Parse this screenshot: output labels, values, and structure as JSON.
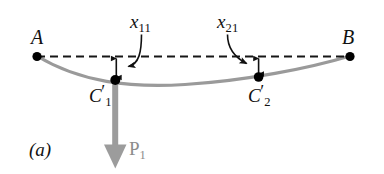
{
  "figure": {
    "panel_label": "(a)",
    "caption_kind": "beam-deflection-diagram",
    "canvas": {
      "width": 384,
      "height": 174,
      "background": "#ffffff"
    },
    "colors": {
      "curve": "#9a9a9a",
      "force_arrow": "#9c9c9c",
      "dashed_line": "#1a1a1a",
      "node": "#000000",
      "text": "#111111",
      "force_label_text": "#8c8c8c"
    },
    "supports": [
      {
        "name": "A",
        "label": "A",
        "x": 37,
        "y": 56
      },
      {
        "name": "B",
        "label": "B",
        "x": 350,
        "y": 56
      }
    ],
    "reference_line": {
      "label": "undeformed-axis",
      "style": "dashed",
      "x1": 37,
      "y1": 56,
      "x2": 350,
      "y2": 56,
      "dash": "8 5"
    },
    "deflected_curve": {
      "label": "deflected-beam",
      "lowest_y": 84,
      "lowest_x": 185,
      "stroke_width": 3
    },
    "stations": [
      {
        "name": "C1",
        "label_main": "C",
        "label_prime": "′",
        "label_sub": "1",
        "x": 115,
        "y": 80,
        "deflection_label_main": "x",
        "deflection_label_sub": "11",
        "deflection_from_y": 57,
        "deflection_to_y": 79
      },
      {
        "name": "C2",
        "label_main": "C",
        "label_prime": "′",
        "label_sub": "2",
        "x": 258,
        "y": 77,
        "deflection_label_main": "x",
        "deflection_label_sub": "21",
        "deflection_from_y": 57,
        "deflection_to_y": 75
      }
    ],
    "force": {
      "name": "P1",
      "label_main": "P",
      "label_sub": "1",
      "direction": "down",
      "applied_at_x": 115,
      "from_y": 82,
      "tip_y": 168,
      "shaft_width": 6,
      "head_width": 23,
      "head_height": 24
    },
    "leaders": [
      {
        "name": "leader-x11",
        "from_x": 140,
        "from_y": 36,
        "to_x": 123,
        "to_y": 66
      },
      {
        "name": "leader-x21",
        "from_x": 228,
        "from_y": 36,
        "to_x": 252,
        "to_y": 63
      }
    ]
  }
}
